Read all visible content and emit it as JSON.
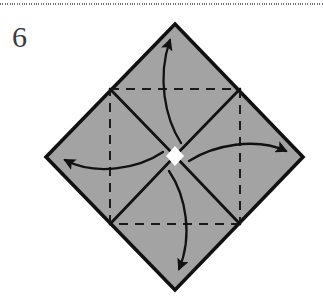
{
  "page": {
    "width": 323,
    "height": 297,
    "background": "#ffffff"
  },
  "top_rule": {
    "name": "dotted-divider",
    "style": "dotted",
    "color": "#6e6e74",
    "y": 3
  },
  "step": {
    "number": "6",
    "label": "Step 6"
  },
  "diagram": {
    "type": "origami-instruction",
    "shape": "diamond",
    "colors": {
      "paper_fill": "#a3a3a3",
      "outline": "#111111",
      "crease_dashed": "#1a1a1a",
      "arrow": "#111111",
      "center_gap": "#ffffff"
    },
    "outer_diamond": {
      "name": "paper-outline",
      "vertices": [
        {
          "label": "top",
          "x": 175,
          "y": 24
        },
        {
          "label": "right",
          "x": 303,
          "y": 157
        },
        {
          "label": "bottom",
          "x": 175,
          "y": 290
        },
        {
          "label": "left",
          "x": 46,
          "y": 157
        }
      ],
      "stroke_width": 3.5
    },
    "inner_square": {
      "name": "crease-square",
      "line_style": "dashed",
      "dash_pattern": "9 7",
      "stroke_width": 2,
      "corners": [
        {
          "label": "top-left",
          "x": 110,
          "y": 89
        },
        {
          "label": "top-right",
          "x": 240,
          "y": 89
        },
        {
          "label": "bottom-right",
          "x": 240,
          "y": 224
        },
        {
          "label": "bottom-left",
          "x": 110,
          "y": 224
        }
      ]
    },
    "center": {
      "x": 175,
      "y": 156
    },
    "diagonal_slits": {
      "name": "open-flap-slits",
      "count": 4,
      "description": "tapered white wedges from inner square corners to center forming an X",
      "from_corners": [
        "top-left",
        "top-right",
        "bottom-right",
        "bottom-left"
      ]
    },
    "arrows": [
      {
        "name": "arrow-to-top",
        "direction": "up",
        "start": {
          "x": 180,
          "y": 142
        },
        "end": {
          "x": 170,
          "y": 36
        },
        "curve": "counter-clockwise"
      },
      {
        "name": "arrow-to-right",
        "direction": "right",
        "start": {
          "x": 188,
          "y": 160
        },
        "end": {
          "x": 290,
          "y": 151
        },
        "curve": "counter-clockwise"
      },
      {
        "name": "arrow-to-bottom",
        "direction": "down",
        "start": {
          "x": 170,
          "y": 172
        },
        "end": {
          "x": 179,
          "y": 272
        },
        "curve": "counter-clockwise"
      },
      {
        "name": "arrow-to-left",
        "direction": "left",
        "start": {
          "x": 162,
          "y": 153
        },
        "end": {
          "x": 60,
          "y": 160
        },
        "curve": "counter-clockwise"
      }
    ]
  }
}
